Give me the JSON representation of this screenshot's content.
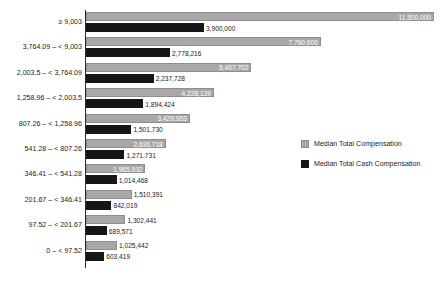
{
  "chart_data": {
    "type": "bar",
    "orientation": "horizontal",
    "title": "",
    "xlabel": "",
    "ylabel": "",
    "grid": false,
    "xlim": [
      0,
      11500000
    ],
    "legend_position": "middle-right",
    "categories": [
      "≥ 9,003",
      "3,764.09 – < 9,003",
      "2,003.5 – < 3,764.09",
      "1,258.96 – < 2,003.5",
      "807.26 – < 1,258.96",
      "541.28 – < 807.26",
      "346.41 – < 541.28",
      "201.67 – < 346.41",
      "97.52 – < 201.67",
      "0 – < 97.52"
    ],
    "series": [
      {
        "name": "Median Total Compensation",
        "color": "#a8a8a8",
        "values": [
          11500000,
          7760606,
          5467702,
          4228139,
          3429953,
          2636718,
          1965932,
          1510391,
          1302441,
          1025442
        ],
        "labels": [
          "11,500,000",
          "7,760,606",
          "5,467,702",
          "4,228,139",
          "3,429,953",
          "2,636,718",
          "1,965,932",
          "1,510,391",
          "1,302,441",
          "1,025,442"
        ]
      },
      {
        "name": "Median Total Cash Compensation",
        "color": "#161616",
        "values": [
          3900000,
          2778216,
          2237728,
          1894424,
          1501730,
          1271731,
          1014468,
          842019,
          689571,
          603419
        ],
        "labels": [
          "3,900,000",
          "2,778,216",
          "2,237,728",
          "1,894,424",
          "1,501,730",
          "1,271,731",
          "1,014,468",
          "842,019",
          "689,571",
          "603,419"
        ]
      }
    ]
  },
  "legend": {
    "items": [
      {
        "label": "Median Total Compensation",
        "color": "#a8a8a8"
      },
      {
        "label": "Median Total Cash Compensation",
        "color": "#161616"
      }
    ]
  }
}
